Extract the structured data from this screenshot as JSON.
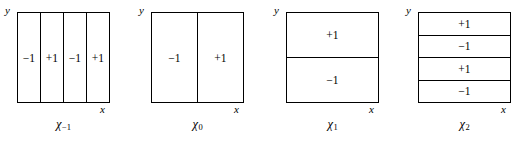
{
  "figure": {
    "axis_labels": {
      "x": "x",
      "y": "y"
    },
    "panels": [
      {
        "caption_symbol": "χ",
        "caption_subscript": "−1",
        "orientation": "vertical",
        "cells": [
          "−1",
          "+1",
          "−1",
          "+1"
        ]
      },
      {
        "caption_symbol": "χ",
        "caption_subscript": "0",
        "orientation": "vertical",
        "cells": [
          "−1",
          "+1"
        ]
      },
      {
        "caption_symbol": "χ",
        "caption_subscript": "1",
        "orientation": "horizontal",
        "cells": [
          "+1",
          "−1"
        ]
      },
      {
        "caption_symbol": "χ",
        "caption_subscript": "2",
        "orientation": "horizontal",
        "cells": [
          "+1",
          "−1",
          "+1",
          "−1"
        ]
      }
    ]
  },
  "chart_data": {
    "type": "heatmap",
    "title": "",
    "xlabel": "x",
    "ylabel": "y",
    "panels": [
      {
        "name": "χ₋₁",
        "partition": "vertical",
        "n_cells": 4,
        "values": [
          -1,
          1,
          -1,
          1
        ],
        "labels": [
          "−1",
          "+1",
          "−1",
          "+1"
        ]
      },
      {
        "name": "χ₀",
        "partition": "vertical",
        "n_cells": 2,
        "values": [
          -1,
          1
        ],
        "labels": [
          "−1",
          "+1"
        ]
      },
      {
        "name": "χ₁",
        "partition": "horizontal",
        "n_cells": 2,
        "values": [
          1,
          -1
        ],
        "labels": [
          "+1",
          "−1"
        ]
      },
      {
        "name": "χ₂",
        "partition": "horizontal",
        "n_cells": 4,
        "values": [
          1,
          -1,
          1,
          -1
        ],
        "labels": [
          "+1",
          "−1",
          "+1",
          "−1"
        ]
      }
    ]
  }
}
